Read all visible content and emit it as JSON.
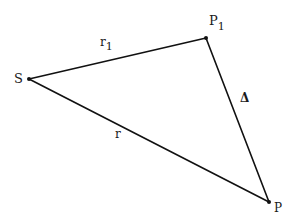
{
  "diagram": {
    "type": "triangle",
    "background": "#ffffff",
    "stroke_color": "#111111",
    "vertices": {
      "S": {
        "label": "S",
        "x": 29,
        "y": 79
      },
      "P1": {
        "label": "P",
        "subscript": "1",
        "x": 206,
        "y": 38
      },
      "P": {
        "label": "P",
        "x": 269,
        "y": 202
      }
    },
    "edges": [
      {
        "from": "S",
        "to": "P1",
        "label": "r",
        "subscript": "1"
      },
      {
        "from": "P1",
        "to": "P",
        "label": "Δ"
      },
      {
        "from": "S",
        "to": "P",
        "label": "r"
      }
    ]
  }
}
